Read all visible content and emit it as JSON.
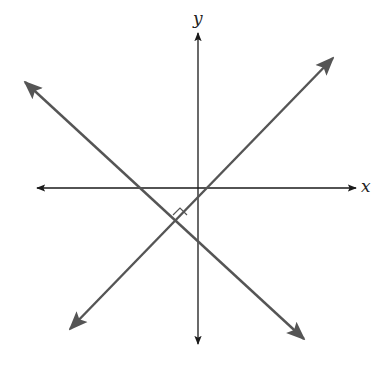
{
  "diagram": {
    "type": "coordinate-plane-perpendicular-lines",
    "axes": {
      "x_label": "x",
      "y_label": "y",
      "origin_px": [
        198,
        188
      ],
      "x_axis": {
        "from": [
          37,
          188
        ],
        "to": [
          356,
          188
        ]
      },
      "y_axis": {
        "from": [
          198,
          33
        ],
        "to": [
          198,
          344
        ]
      }
    },
    "lines": [
      {
        "name": "line-positive-slope",
        "from": [
          70,
          329
        ],
        "to": [
          333,
          58
        ],
        "arrows": "both"
      },
      {
        "name": "line-negative-slope",
        "from": [
          25,
          82
        ],
        "to": [
          304,
          339
        ],
        "arrows": "both"
      }
    ],
    "intersection_px": [
      180,
      222
    ],
    "right_angle_marker": true,
    "colors": {
      "axis": "#1a1a1a",
      "line": "#555555",
      "background": "#ffffff"
    }
  }
}
